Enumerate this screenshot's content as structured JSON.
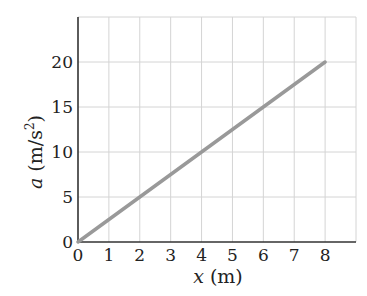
{
  "chart_data": {
    "type": "line",
    "title": "",
    "xlabel": "x (m)",
    "ylabel": "a (m/s²)",
    "xlim": [
      0,
      9
    ],
    "ylim": [
      0,
      25
    ],
    "grid": true,
    "x_ticks": [
      0,
      1,
      2,
      3,
      4,
      5,
      6,
      7,
      8
    ],
    "y_ticks": [
      0,
      5,
      10,
      15,
      20
    ],
    "series": [
      {
        "name": "a(x)",
        "x": [
          0,
          8
        ],
        "y": [
          0,
          20
        ],
        "color": "#999999"
      }
    ],
    "legend": null
  },
  "labels": {
    "x_var": "x",
    "x_unit": "(m)",
    "y_var": "a",
    "y_unit_open": "(m/s",
    "y_unit_exp": "2",
    "y_unit_close": ")"
  },
  "colors": {
    "axis": "#333333",
    "grid": "#d4d4d4",
    "line": "#999999"
  }
}
